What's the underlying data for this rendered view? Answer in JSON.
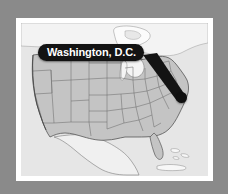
{
  "figure": {
    "type": "locator-map",
    "region": "United States",
    "background_color": "#8a8a8a",
    "frame_color": "#ffffff",
    "map_style": "grayscale"
  },
  "callout": {
    "label": "Washington, D.C.",
    "background_color": "#131313",
    "text_color": "#ffffff"
  },
  "marker": {
    "name": "washington-dc",
    "color": "#101010",
    "x_pct": 79,
    "y_pct": 47
  },
  "map": {
    "land_color": "#c2c2c2",
    "neighbor_color": "#ececec",
    "water_color": "#e4e4e4",
    "border_color": "#6a6a6a",
    "coast_color": "#3a3a3a",
    "areas": [
      {
        "name": "canada",
        "fill": "#f2f2f2"
      },
      {
        "name": "united-states",
        "fill": "#c2c2c2"
      },
      {
        "name": "mexico",
        "fill": "#efefef"
      },
      {
        "name": "cuba",
        "fill": "#f4f4f4"
      },
      {
        "name": "bahamas",
        "fill": "#f4f4f4"
      },
      {
        "name": "great-lakes",
        "fill": "#f0f0f0"
      },
      {
        "name": "atlantic-ocean",
        "fill": "#e4e4e4"
      },
      {
        "name": "pacific-ocean",
        "fill": "#e4e4e4"
      },
      {
        "name": "gulf-of-mexico",
        "fill": "#e9e9e9"
      }
    ]
  }
}
